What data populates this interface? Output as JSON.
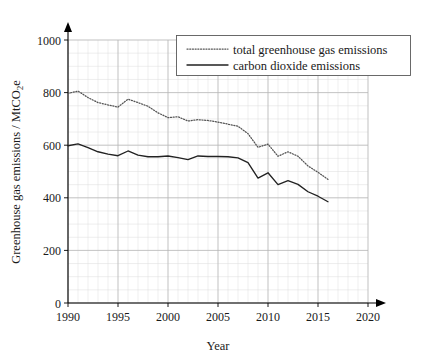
{
  "chart_data": {
    "type": "line",
    "title": "",
    "xlabel": "Year",
    "ylabel": "Greenhouse gas emissions / MtCO2e",
    "ylabel_parts": {
      "main": "Greenhouse gas emissions / MtCO",
      "subscript": "2",
      "tail": "e"
    },
    "xlim": [
      1990,
      2020
    ],
    "ylim": [
      0,
      1000
    ],
    "grid": true,
    "grid_major_x_step": 5,
    "grid_major_y_step": 200,
    "grid_minor_x_step": 1,
    "grid_minor_y_step": 50,
    "legend_position": "top-right",
    "xticks": [
      1990,
      1995,
      2000,
      2005,
      2010,
      2015,
      2020
    ],
    "xtick_labels": [
      "1990",
      "1995",
      "2000",
      "2005",
      "2010",
      "2015",
      "2020"
    ],
    "yticks": [
      0,
      200,
      400,
      600,
      800,
      1000
    ],
    "ytick_labels": [
      "0",
      "200",
      "400",
      "600",
      "800",
      "1000"
    ],
    "x": [
      1990,
      1991,
      1992,
      1993,
      1994,
      1995,
      1996,
      1997,
      1998,
      1999,
      2000,
      2001,
      2002,
      2003,
      2004,
      2005,
      2006,
      2007,
      2008,
      2009,
      2010,
      2011,
      2012,
      2013,
      2014,
      2015,
      2016
    ],
    "series": [
      {
        "name": "total greenhouse gas emissions",
        "style": "dotted",
        "color": "#555555",
        "values": [
          797,
          806,
          781,
          762,
          753,
          745,
          775,
          762,
          748,
          723,
          705,
          708,
          692,
          697,
          694,
          688,
          680,
          672,
          644,
          592,
          604,
          558,
          575,
          558,
          521,
          497,
          470
        ]
      },
      {
        "name": "carbon dioxide emissions",
        "style": "solid",
        "color": "#222222",
        "values": [
          598,
          605,
          591,
          575,
          566,
          560,
          578,
          562,
          556,
          556,
          559,
          553,
          545,
          559,
          557,
          557,
          556,
          552,
          534,
          475,
          495,
          450,
          465,
          451,
          423,
          406,
          385
        ]
      }
    ]
  },
  "legend": {
    "items": [
      {
        "label": "total greenhouse gas emissions",
        "style": "dotted"
      },
      {
        "label": "carbon dioxide emissions",
        "style": "solid"
      }
    ]
  }
}
